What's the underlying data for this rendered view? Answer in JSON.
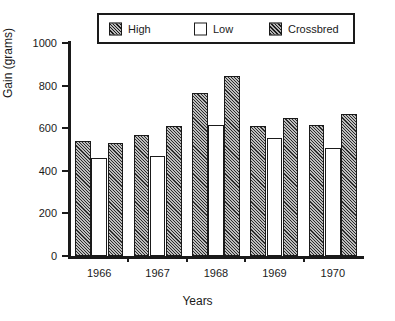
{
  "chart_data": {
    "type": "bar",
    "title": "",
    "xlabel": "Years",
    "ylabel": "Gain (grams)",
    "categories": [
      "1966",
      "1967",
      "1968",
      "1969",
      "1970"
    ],
    "ylim": [
      0,
      1000
    ],
    "yticks": [
      0,
      200,
      400,
      600,
      800,
      1000
    ],
    "ytick_labels": [
      "0",
      "200",
      "400",
      "600",
      "800",
      "1000"
    ],
    "grid": false,
    "legend_position": "top",
    "series": [
      {
        "name": "High",
        "pattern": "diagonal-hatch",
        "values": [
          540,
          570,
          765,
          610,
          615
        ]
      },
      {
        "name": "Low",
        "pattern": "solid-white",
        "values": [
          460,
          470,
          615,
          555,
          505
        ]
      },
      {
        "name": "Crossbred",
        "pattern": "diagonal-hatch",
        "values": [
          530,
          610,
          845,
          650,
          665
        ]
      }
    ]
  },
  "legend": {
    "entries": [
      {
        "label": "High"
      },
      {
        "label": "Low"
      },
      {
        "label": "Crossbred"
      }
    ]
  },
  "colors": {
    "axis": "#1a1a1a",
    "bar_fill": "#bdbdbd",
    "bar_stroke": "#1a1a1a",
    "background": "#ffffff"
  }
}
